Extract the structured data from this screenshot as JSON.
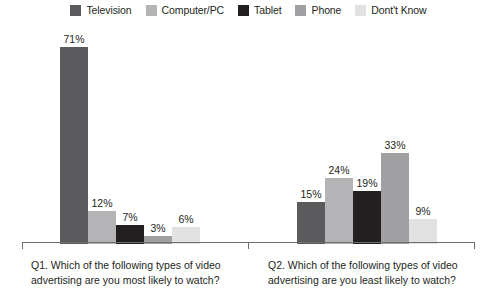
{
  "legend": {
    "items": [
      {
        "label": "Television",
        "color": "#5b5b5d",
        "swatch_name": "legend-swatch-television"
      },
      {
        "label": "Computer/PC",
        "color": "#b4b4b6",
        "swatch_name": "legend-swatch-computer-pc"
      },
      {
        "label": "Tablet",
        "color": "#231f20",
        "swatch_name": "legend-swatch-tablet"
      },
      {
        "label": "Phone",
        "color": "#a0a0a2",
        "swatch_name": "legend-swatch-phone"
      },
      {
        "label": "Dont't Know",
        "color": "#e2e2e3",
        "swatch_name": "legend-swatch-dont-know"
      }
    ]
  },
  "captions": {
    "q1": "Q1. Which of the following types of video advertising are you most likely to watch?",
    "q2": "Q2. Which of the following types of video advertising are you least likely to watch?"
  },
  "chart_data": {
    "type": "bar",
    "title": "",
    "xlabel": "",
    "ylabel": "",
    "ylim": [
      0,
      80
    ],
    "grid": false,
    "legend_position": "top",
    "categories": [
      "Q1. Which of the following types of video advertising are you most likely to watch?",
      "Q2. Which of the following types of video advertising are you least likely to watch?"
    ],
    "series": [
      {
        "name": "Television",
        "color": "#5b5b5d",
        "values": [
          71,
          15
        ],
        "labels": [
          "71%",
          "15%"
        ]
      },
      {
        "name": "Computer/PC",
        "color": "#b4b4b6",
        "values": [
          12,
          24
        ],
        "labels": [
          "12%",
          "24%"
        ]
      },
      {
        "name": "Tablet",
        "color": "#231f20",
        "values": [
          7,
          19
        ],
        "labels": [
          "7%",
          "19%"
        ]
      },
      {
        "name": "Phone",
        "color": "#a0a0a2",
        "values": [
          3,
          33
        ],
        "labels": [
          "3%",
          "33%"
        ]
      },
      {
        "name": "Dont't Know",
        "color": "#e2e2e3",
        "values": [
          6,
          9
        ],
        "labels": [
          "6%",
          "9%"
        ]
      }
    ]
  }
}
